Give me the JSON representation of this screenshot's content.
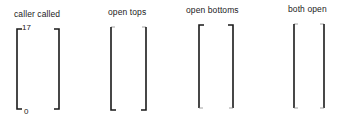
{
  "diagram": {
    "panels": [
      {
        "id": "caller-called",
        "title": "caller called",
        "top_value": "17",
        "bottom_value": "0",
        "top_closed": true,
        "bottom_closed": true,
        "left_x": 17,
        "right_x": 59,
        "top_y": 29,
        "bottom_y": 109,
        "title_x": 14,
        "title_y": 9
      },
      {
        "id": "open-tops",
        "title": "open tops",
        "top_closed": false,
        "bottom_closed": true,
        "left_x": 111,
        "right_x": 146,
        "top_y": 27,
        "bottom_y": 110,
        "title_x": 108,
        "title_y": 7
      },
      {
        "id": "open-bottoms",
        "title": "open bottoms",
        "top_closed": true,
        "bottom_closed": false,
        "left_x": 199,
        "right_x": 233,
        "top_y": 25,
        "bottom_y": 108,
        "title_x": 186,
        "title_y": 5
      },
      {
        "id": "both-open",
        "title": "both open",
        "top_closed": false,
        "bottom_closed": false,
        "left_x": 294,
        "right_x": 324,
        "top_y": 24,
        "bottom_y": 108,
        "title_x": 288,
        "title_y": 4
      }
    ],
    "colors": {
      "stroke": "#1a1a1a",
      "open_stroke": "#8a8a8a"
    }
  }
}
